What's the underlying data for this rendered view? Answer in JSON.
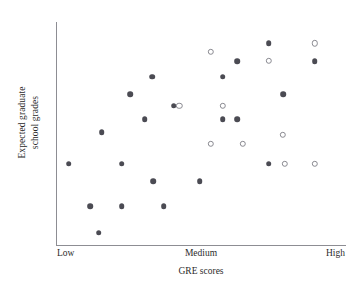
{
  "chart_data": {
    "type": "scatter",
    "title": "",
    "xlabel": "GRE scores",
    "ylabel": "Expected graduate school grades",
    "ylabel_lines": [
      "Expected graduate",
      "school grades"
    ],
    "xtick_labels": [
      "Low",
      "Medium",
      "High"
    ],
    "xtick_positions": [
      0,
      50,
      100
    ],
    "ytick_labels": [],
    "xlim": [
      0,
      100
    ],
    "ylim": [
      0,
      100
    ],
    "grid": false,
    "legend": null,
    "series": [
      {
        "name": "filled-markers",
        "marker": "filled-circle",
        "color": "#4b4b53",
        "points": [
          {
            "x": 4.0,
            "y": 36.5
          },
          {
            "x": 11.5,
            "y": 17.5
          },
          {
            "x": 14.5,
            "y": 5.5
          },
          {
            "x": 15.5,
            "y": 50.5
          },
          {
            "x": 22.5,
            "y": 36.5
          },
          {
            "x": 22.5,
            "y": 17.5
          },
          {
            "x": 25.5,
            "y": 67.5
          },
          {
            "x": 30.5,
            "y": 56.5
          },
          {
            "x": 33.0,
            "y": 75.5
          },
          {
            "x": 33.5,
            "y": 28.5
          },
          {
            "x": 37.0,
            "y": 17.5
          },
          {
            "x": 40.5,
            "y": 62.5
          },
          {
            "x": 49.5,
            "y": 28.5
          },
          {
            "x": 57.5,
            "y": 75.5
          },
          {
            "x": 57.5,
            "y": 56.5
          },
          {
            "x": 62.5,
            "y": 82.5
          },
          {
            "x": 62.5,
            "y": 56.5
          },
          {
            "x": 73.5,
            "y": 90.5
          },
          {
            "x": 73.5,
            "y": 36.5
          },
          {
            "x": 78.5,
            "y": 67.5
          },
          {
            "x": 89.5,
            "y": 82.5
          }
        ]
      },
      {
        "name": "open-markers",
        "marker": "open-circle",
        "color": "#8a8a91",
        "points": [
          {
            "x": 42.5,
            "y": 62.5
          },
          {
            "x": 53.5,
            "y": 86.5
          },
          {
            "x": 53.5,
            "y": 45.5
          },
          {
            "x": 57.5,
            "y": 62.5
          },
          {
            "x": 64.5,
            "y": 45.5
          },
          {
            "x": 73.5,
            "y": 82.5
          },
          {
            "x": 78.5,
            "y": 49.5
          },
          {
            "x": 79.0,
            "y": 36.5
          },
          {
            "x": 89.5,
            "y": 36.5
          },
          {
            "x": 89.5,
            "y": 90.5
          }
        ]
      }
    ]
  }
}
